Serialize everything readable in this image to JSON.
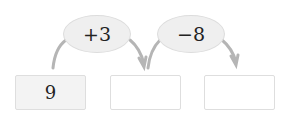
{
  "diagram": {
    "type": "number-chain",
    "start_value": "9",
    "operations": [
      {
        "label": "+3"
      },
      {
        "label": "−8"
      }
    ],
    "boxes": [
      {
        "value": "9",
        "filled": true
      },
      {
        "value": "",
        "filled": false
      },
      {
        "value": "",
        "filled": false
      }
    ],
    "colors": {
      "ellipse_fill": "#efefef",
      "ellipse_border": "#dcdcdc",
      "arrow": "#b5b5b5",
      "box_border": "#dedede",
      "filled_box": "#f3f3f3"
    }
  }
}
